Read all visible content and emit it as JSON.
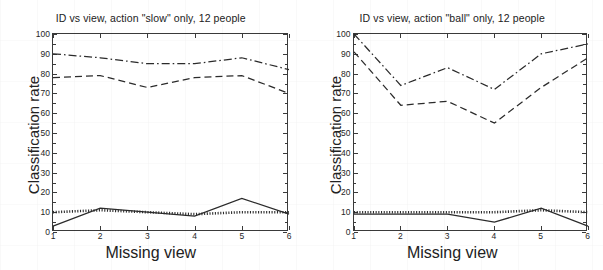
{
  "figure": {
    "width": 603,
    "height": 270,
    "background": "#ffffff",
    "line_color": "#2b2b2b"
  },
  "chart_data": [
    {
      "type": "line",
      "panel": "left",
      "title": "ID vs view, action \"slow\" only, 12 people",
      "xlabel": "Missing view",
      "ylabel": "Classification rate",
      "x": [
        1,
        2,
        3,
        4,
        5,
        6
      ],
      "xlim": [
        1,
        6
      ],
      "ylim": [
        0,
        100
      ],
      "xticks": [
        "1",
        "2",
        "3",
        "4",
        "5",
        "6"
      ],
      "yticks": [
        "0",
        "10",
        "20",
        "30",
        "40",
        "50",
        "60",
        "70",
        "80",
        "90",
        "100"
      ],
      "grid": false,
      "legend": "none",
      "series": [
        {
          "name": "dash-dot-upper",
          "style": "dashdot",
          "color": "#2b2b2b",
          "values": [
            90,
            88,
            85,
            85,
            88,
            82
          ]
        },
        {
          "name": "dashed-middle",
          "style": "dashed",
          "color": "#2b2b2b",
          "values": [
            78,
            79,
            73,
            78,
            79,
            70
          ]
        },
        {
          "name": "dotted-baseline",
          "style": "dotted",
          "color": "#2b2b2b",
          "values": [
            10,
            11,
            10,
            9,
            10,
            10
          ]
        },
        {
          "name": "solid-baseline",
          "style": "solid",
          "color": "#2b2b2b",
          "values": [
            3,
            12,
            10,
            8,
            17,
            9
          ]
        }
      ]
    },
    {
      "type": "line",
      "panel": "right",
      "title": "ID vs view, action \"ball\" only, 12 people",
      "xlabel": "Missing view",
      "ylabel": "Classification rate",
      "x": [
        1,
        2,
        3,
        4,
        5,
        6
      ],
      "xlim": [
        1,
        6
      ],
      "ylim": [
        0,
        100
      ],
      "xticks": [
        "1",
        "2",
        "3",
        "4",
        "5",
        "6"
      ],
      "yticks": [
        "0",
        "10",
        "20",
        "30",
        "40",
        "50",
        "60",
        "70",
        "80",
        "90",
        "100"
      ],
      "grid": false,
      "legend": "none",
      "series": [
        {
          "name": "dash-dot-upper",
          "style": "dashdot",
          "color": "#2b2b2b",
          "values": [
            100,
            74,
            83,
            72,
            90,
            95
          ]
        },
        {
          "name": "dashed-middle",
          "style": "dashed",
          "color": "#2b2b2b",
          "values": [
            91,
            64,
            66,
            55,
            73,
            88
          ]
        },
        {
          "name": "dotted-baseline",
          "style": "dotted",
          "color": "#2b2b2b",
          "values": [
            10,
            10,
            10,
            10,
            11,
            10
          ]
        },
        {
          "name": "solid-baseline",
          "style": "solid",
          "color": "#2b2b2b",
          "values": [
            9,
            9,
            9,
            5,
            12,
            3
          ]
        }
      ]
    }
  ]
}
